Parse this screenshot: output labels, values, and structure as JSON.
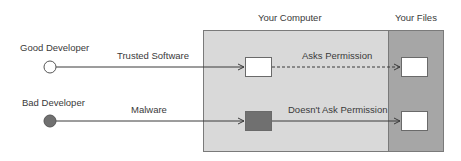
{
  "regions": {
    "computer": {
      "label": "Your Computer",
      "color": "#d9d9d9"
    },
    "files": {
      "label": "Your Files",
      "color": "#a6a6a6"
    }
  },
  "actors": [
    {
      "label": "Good Developer",
      "color": "#ffffff"
    },
    {
      "label": "Bad Developer",
      "color": "#707070"
    }
  ],
  "flows": [
    {
      "label": "Trusted Software",
      "next_label": "Asks Permission",
      "next_style": "dashed",
      "box_color": "#ffffff"
    },
    {
      "label": "Malware",
      "next_label": "Doesn't Ask Permission",
      "next_style": "solid",
      "box_color": "#707070"
    }
  ],
  "file_box_color": "#ffffff"
}
